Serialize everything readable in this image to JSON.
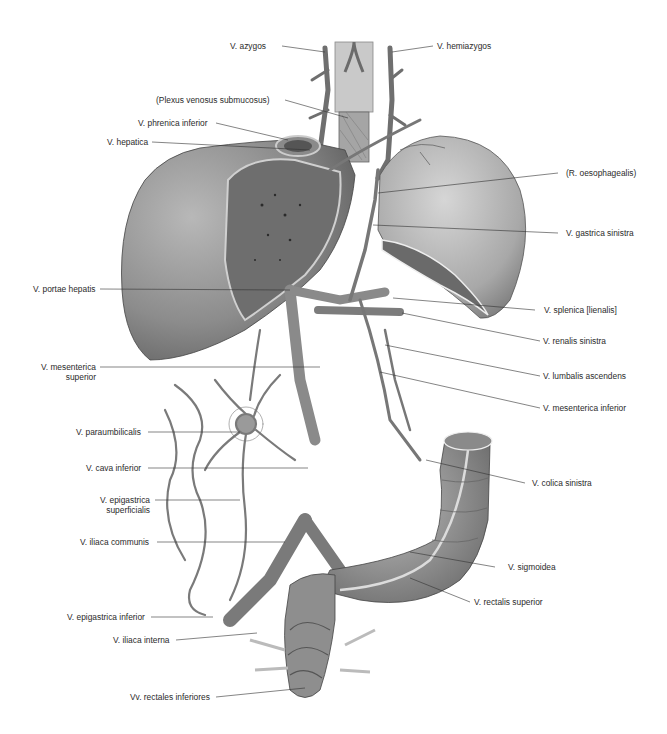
{
  "figure": {
    "type": "anatomical illustration",
    "colors": {
      "background": "#ffffff",
      "organ_fill": "#9a9a9a",
      "organ_dark": "#6e6e6e",
      "vessel": "#7c7c7c",
      "vessel_edge": "#4a4a4a",
      "leader": "#333333",
      "text": "#2b2b2b"
    }
  },
  "labels": {
    "azygos": "V. azygos",
    "hemiazygos": "V. hemiazygos",
    "plexus": "(Plexus venosus submucosus)",
    "phrenica": "V. phrenica inferior",
    "hepatica": "V. hepatica",
    "oesophagealis": "(R. oesophagealis)",
    "gastrica_sinistra": "V. gastrica sinistra",
    "portae_hepatis": "V. portae hepatis",
    "splenica": "V. splenica [lienalis]",
    "renalis_sinistra": "V. renalis sinistra",
    "mesenterica_superior_1": "V. mesenterica",
    "mesenterica_superior_2": "superior",
    "lumbalis_ascendens": "V. lumbalis ascendens",
    "mesenterica_inferior": "V. mesenterica inferior",
    "paraumbilicalis": "V. paraumbilicalis",
    "cava_inferior": "V. cava inferior",
    "colica_sinistra": "V. colica sinistra",
    "epigastrica_superficialis_1": "V. epigastrica",
    "epigastrica_superficialis_2": "superficialis",
    "iliaca_communis": "V. iliaca communis",
    "sigmoidea": "V. sigmoidea",
    "epigastrica_inferior": "V. epigastrica inferior",
    "rectalis_superior": "V. rectalis superior",
    "iliaca_interna": "V. iliaca interna",
    "rectales_inferiores": "Vv. rectales inferiores"
  }
}
